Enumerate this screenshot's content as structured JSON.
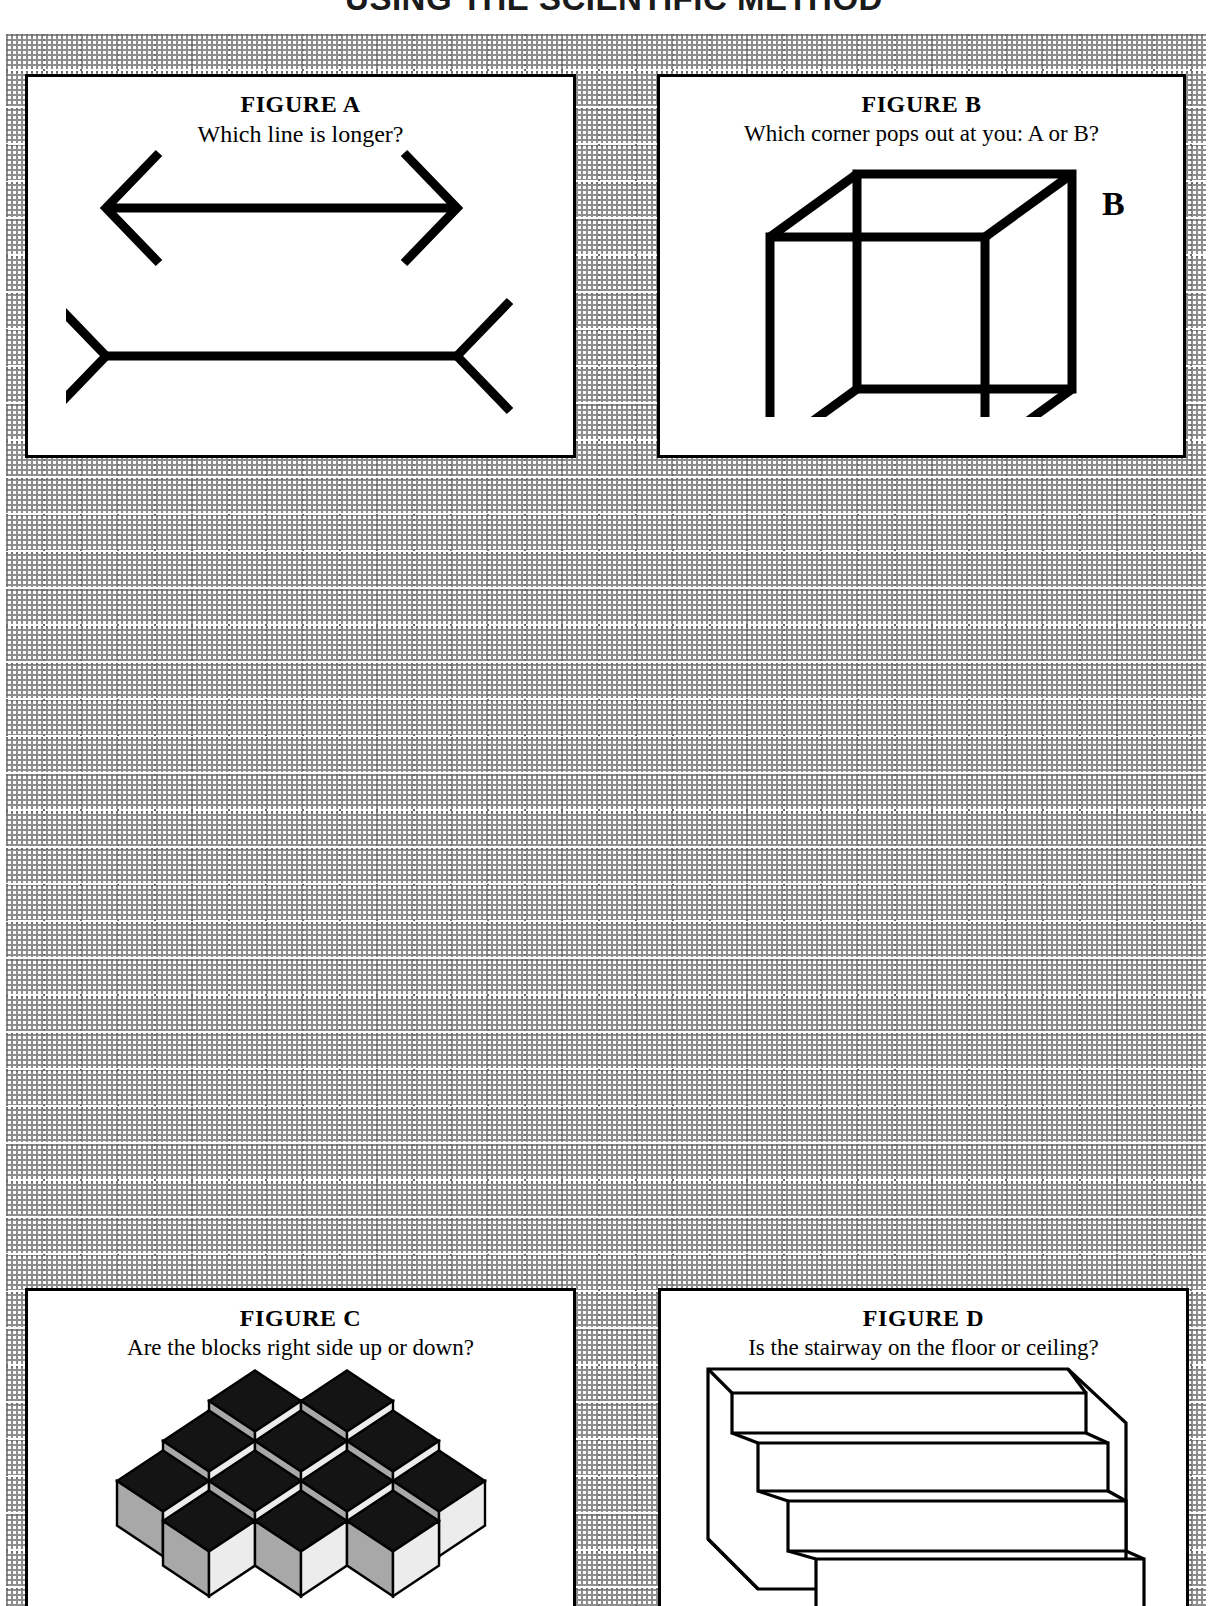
{
  "worksheet": {
    "title": "USING THE SCIENTIFIC METHOD",
    "background": "#ffffff",
    "grid_color": "#707070",
    "ink_color": "#000000"
  },
  "figures": [
    {
      "id": "a",
      "heading": "FIGURE A",
      "question": "Which line is longer?",
      "illusion": "muller-lyer",
      "art_labels": []
    },
    {
      "id": "b",
      "heading": "FIGURE B",
      "question": "Which corner pops out at you: A or B?",
      "illusion": "necker-cube",
      "art_labels": [
        {
          "text": "B",
          "position": "top-right"
        },
        {
          "text": "A",
          "position": "bottom-left"
        }
      ]
    },
    {
      "id": "c",
      "heading": "FIGURE C",
      "question": "Are the blocks right side up or down?",
      "illusion": "tumbling-blocks",
      "art_labels": [],
      "face_colors": {
        "top": "#141414",
        "left": "#a8a8a8",
        "right": "#ececec"
      }
    },
    {
      "id": "d",
      "heading": "FIGURE D",
      "question": "Is the stairway on the floor or ceiling?",
      "illusion": "schroder-staircase",
      "art_labels": []
    }
  ]
}
